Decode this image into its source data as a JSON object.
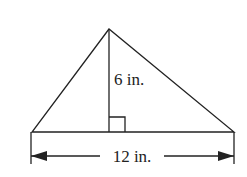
{
  "diagram": {
    "shape": "triangle",
    "height_label": "6 in.",
    "base_label": "12 in.",
    "height_value": 6,
    "base_value": 12,
    "unit": "in.",
    "right_angle_marker": true,
    "stroke_color": "#222222"
  }
}
